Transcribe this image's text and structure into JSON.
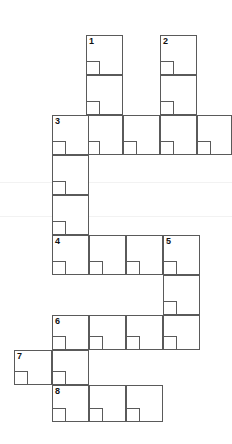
{
  "puzzle": {
    "type": "crossword-grid",
    "title": "",
    "width": 232,
    "height": 444,
    "cell_size": 37,
    "grid_color": "#5a5a5a",
    "background_color": "#ffffff",
    "number_color": "#111111",
    "columns_x": [
      14,
      52,
      89,
      126,
      163,
      200,
      232
    ],
    "rows_y": [
      35,
      75,
      115,
      155,
      195,
      235,
      275,
      315,
      350,
      385,
      422
    ]
  },
  "clue_numbers": [
    {
      "label": "1",
      "x": 86,
      "y": 35
    },
    {
      "label": "2",
      "x": 160,
      "y": 35
    },
    {
      "label": "3",
      "x": 52,
      "y": 115
    },
    {
      "label": "4",
      "x": 52,
      "y": 235
    },
    {
      "label": "5",
      "x": 163,
      "y": 235
    },
    {
      "label": "6",
      "x": 52,
      "y": 315
    },
    {
      "label": "7",
      "x": 14,
      "y": 350
    },
    {
      "label": "8",
      "x": 52,
      "y": 385
    }
  ],
  "entries": [
    {
      "name": "entry-1-down",
      "number": "1",
      "direction": "down",
      "length": 3,
      "x": 86,
      "y": 35,
      "cell_w": 37,
      "cell_h": 40
    },
    {
      "name": "entry-2-down",
      "number": "2",
      "direction": "down",
      "length": 3,
      "x": 160,
      "y": 35,
      "cell_w": 37,
      "cell_h": 40
    },
    {
      "name": "entry-3-across",
      "number": "3",
      "direction": "across",
      "length": 5,
      "x": 52,
      "y": 115,
      "cell_w": 37,
      "cell_h": 40
    },
    {
      "name": "entry-3-down",
      "number": "3",
      "direction": "down",
      "length": 4,
      "x": 52,
      "y": 115,
      "cell_w": 37,
      "cell_h": 40
    },
    {
      "name": "entry-4-across",
      "number": "4",
      "direction": "across",
      "length": 4,
      "x": 52,
      "y": 235,
      "cell_w": 37,
      "cell_h": 40
    },
    {
      "name": "entry-5-down",
      "number": "5",
      "direction": "down",
      "length": 3,
      "x": 163,
      "y": 235,
      "cell_w": 37,
      "cell_h": 38
    },
    {
      "name": "entry-6-across",
      "number": "6",
      "direction": "across",
      "length": 4,
      "x": 52,
      "y": 315,
      "cell_w": 37,
      "cell_h": 35
    },
    {
      "name": "entry-7-across",
      "number": "7",
      "direction": "across",
      "length": 2,
      "x": 14,
      "y": 350,
      "cell_w": 38,
      "cell_h": 35
    },
    {
      "name": "entry-8-across",
      "number": "8",
      "direction": "across",
      "length": 3,
      "x": 52,
      "y": 385,
      "cell_w": 37,
      "cell_h": 37
    }
  ],
  "cells": [
    {
      "name": "cell-r1-c1",
      "x": 86,
      "y": 35,
      "w": 37,
      "h": 40,
      "number": "1"
    },
    {
      "name": "cell-r2-c1",
      "x": 86,
      "y": 75,
      "w": 37,
      "h": 40,
      "number": ""
    },
    {
      "name": "cell-r3-c1",
      "x": 86,
      "y": 115,
      "w": 37,
      "h": 40,
      "number": ""
    },
    {
      "name": "cell-r1-c2",
      "x": 160,
      "y": 35,
      "w": 37,
      "h": 40,
      "number": "2"
    },
    {
      "name": "cell-r2-c2",
      "x": 160,
      "y": 75,
      "w": 37,
      "h": 40,
      "number": ""
    },
    {
      "name": "cell-r3-c2",
      "x": 160,
      "y": 115,
      "w": 37,
      "h": 40,
      "number": ""
    },
    {
      "name": "cell-r3-a1",
      "x": 52,
      "y": 115,
      "w": 37,
      "h": 40,
      "number": "3"
    },
    {
      "name": "cell-r3-a2",
      "x": 123,
      "y": 115,
      "w": 37,
      "h": 40,
      "number": ""
    },
    {
      "name": "cell-r3-a3",
      "x": 197,
      "y": 115,
      "w": 35,
      "h": 40,
      "number": ""
    },
    {
      "name": "cell-r4-d1",
      "x": 52,
      "y": 155,
      "w": 37,
      "h": 40,
      "number": ""
    },
    {
      "name": "cell-r5-d1",
      "x": 52,
      "y": 195,
      "w": 37,
      "h": 40,
      "number": ""
    },
    {
      "name": "cell-r6-a1",
      "x": 52,
      "y": 235,
      "w": 37,
      "h": 40,
      "number": "4"
    },
    {
      "name": "cell-r6-a2",
      "x": 89,
      "y": 235,
      "w": 37,
      "h": 40,
      "number": ""
    },
    {
      "name": "cell-r6-a3",
      "x": 126,
      "y": 235,
      "w": 37,
      "h": 40,
      "number": ""
    },
    {
      "name": "cell-r6-a4",
      "x": 163,
      "y": 235,
      "w": 37,
      "h": 40,
      "number": "5"
    },
    {
      "name": "cell-r7-c5",
      "x": 163,
      "y": 275,
      "w": 37,
      "h": 40,
      "number": ""
    },
    {
      "name": "cell-r8-c5",
      "x": 163,
      "y": 315,
      "w": 37,
      "h": 35,
      "number": ""
    },
    {
      "name": "cell-r8-a1",
      "x": 52,
      "y": 315,
      "w": 37,
      "h": 35,
      "number": "6"
    },
    {
      "name": "cell-r8-a2",
      "x": 89,
      "y": 315,
      "w": 37,
      "h": 35,
      "number": ""
    },
    {
      "name": "cell-r8-a3",
      "x": 126,
      "y": 315,
      "w": 37,
      "h": 35,
      "number": ""
    },
    {
      "name": "cell-r9-a1",
      "x": 14,
      "y": 350,
      "w": 38,
      "h": 35,
      "number": "7"
    },
    {
      "name": "cell-r9-a2",
      "x": 52,
      "y": 350,
      "w": 37,
      "h": 35,
      "number": ""
    },
    {
      "name": "cell-r10-a1",
      "x": 52,
      "y": 385,
      "w": 37,
      "h": 37,
      "number": "8"
    },
    {
      "name": "cell-r10-a2",
      "x": 89,
      "y": 385,
      "w": 37,
      "h": 37,
      "number": ""
    },
    {
      "name": "cell-r10-a3",
      "x": 126,
      "y": 385,
      "w": 37,
      "h": 37,
      "number": ""
    }
  ],
  "guides": [
    {
      "name": "faint-guide-top",
      "y": 182
    },
    {
      "name": "faint-guide-bottom",
      "y": 216
    }
  ]
}
